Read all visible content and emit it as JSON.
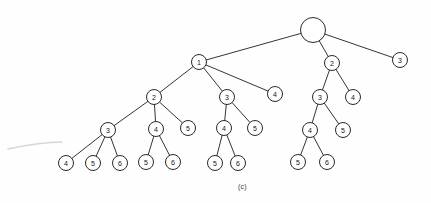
{
  "figure": {
    "caption": "(c)",
    "caption_x": 238,
    "caption_y": 183,
    "width": 431,
    "height": 203,
    "background_color": "#fefefe",
    "ink_color": "#1d1d1d",
    "artifact_color": "#d8d6d2"
  },
  "chart_data": {
    "type": "diagram",
    "title": "(c)",
    "diagram_kind": "rooted-tree",
    "node_radius": 7.5,
    "root_radius": 12.5,
    "nodes": [
      {
        "id": "root",
        "label": "",
        "x": 313,
        "y": 30,
        "r": 12.5,
        "level": 0
      },
      {
        "id": "n1",
        "label": "1",
        "x": 199,
        "y": 62,
        "r": 7.5,
        "level": 1
      },
      {
        "id": "n2",
        "label": "2",
        "x": 332,
        "y": 63,
        "r": 7.5,
        "level": 1
      },
      {
        "id": "n3",
        "label": "3",
        "x": 400,
        "y": 60,
        "r": 7.5,
        "level": 1
      },
      {
        "id": "n1a",
        "label": "2",
        "x": 154,
        "y": 97,
        "r": 7.5,
        "level": 2
      },
      {
        "id": "n1b",
        "label": "3",
        "x": 227,
        "y": 97,
        "r": 7.5,
        "level": 2
      },
      {
        "id": "n1c",
        "label": "4",
        "x": 275,
        "y": 94,
        "r": 7.5,
        "level": 2
      },
      {
        "id": "n2a",
        "label": "3",
        "x": 320,
        "y": 97,
        "r": 7.5,
        "level": 2
      },
      {
        "id": "n2b",
        "label": "4",
        "x": 353,
        "y": 97,
        "r": 7.5,
        "level": 2
      },
      {
        "id": "n1a1",
        "label": "3",
        "x": 108,
        "y": 130,
        "r": 7.5,
        "level": 3
      },
      {
        "id": "n1a2",
        "label": "4",
        "x": 156,
        "y": 129,
        "r": 7.5,
        "level": 3
      },
      {
        "id": "n1a3",
        "label": "5",
        "x": 188,
        "y": 128,
        "r": 7.5,
        "level": 3
      },
      {
        "id": "n1b1",
        "label": "4",
        "x": 224,
        "y": 128,
        "r": 7.5,
        "level": 3
      },
      {
        "id": "n1b2",
        "label": "5",
        "x": 255,
        "y": 128,
        "r": 7.5,
        "level": 3
      },
      {
        "id": "n2a1",
        "label": "4",
        "x": 310,
        "y": 130,
        "r": 7.5,
        "level": 3
      },
      {
        "id": "n2a2",
        "label": "5",
        "x": 343,
        "y": 130,
        "r": 7.5,
        "level": 3
      },
      {
        "id": "n1a1x",
        "label": "4",
        "x": 66,
        "y": 163,
        "r": 7.5,
        "level": 4
      },
      {
        "id": "n1a1y",
        "label": "5",
        "x": 93,
        "y": 163,
        "r": 7.5,
        "level": 4
      },
      {
        "id": "n1a1z",
        "label": "6",
        "x": 120,
        "y": 163,
        "r": 7.5,
        "level": 4
      },
      {
        "id": "n1a2x",
        "label": "5",
        "x": 146,
        "y": 162,
        "r": 7.5,
        "level": 4
      },
      {
        "id": "n1a2y",
        "label": "6",
        "x": 173,
        "y": 162,
        "r": 7.5,
        "level": 4
      },
      {
        "id": "n1b1x",
        "label": "5",
        "x": 215,
        "y": 163,
        "r": 7.5,
        "level": 4
      },
      {
        "id": "n1b1y",
        "label": "6",
        "x": 238,
        "y": 163,
        "r": 7.5,
        "level": 4
      },
      {
        "id": "n2a1x",
        "label": "5",
        "x": 298,
        "y": 162,
        "r": 7.5,
        "level": 4
      },
      {
        "id": "n2a1y",
        "label": "6",
        "x": 327,
        "y": 162,
        "r": 7.5,
        "level": 4
      }
    ],
    "edges": [
      {
        "from": "root",
        "to": "n1"
      },
      {
        "from": "root",
        "to": "n2"
      },
      {
        "from": "root",
        "to": "n3"
      },
      {
        "from": "n1",
        "to": "n1a"
      },
      {
        "from": "n1",
        "to": "n1b"
      },
      {
        "from": "n1",
        "to": "n1c"
      },
      {
        "from": "n2",
        "to": "n2a"
      },
      {
        "from": "n2",
        "to": "n2b"
      },
      {
        "from": "n1a",
        "to": "n1a1"
      },
      {
        "from": "n1a",
        "to": "n1a2"
      },
      {
        "from": "n1a",
        "to": "n1a3"
      },
      {
        "from": "n1b",
        "to": "n1b1"
      },
      {
        "from": "n1b",
        "to": "n1b2"
      },
      {
        "from": "n2a",
        "to": "n2a1"
      },
      {
        "from": "n2a",
        "to": "n2a2"
      },
      {
        "from": "n1a1",
        "to": "n1a1x"
      },
      {
        "from": "n1a1",
        "to": "n1a1y"
      },
      {
        "from": "n1a1",
        "to": "n1a1z"
      },
      {
        "from": "n1a2",
        "to": "n1a2x"
      },
      {
        "from": "n1a2",
        "to": "n1a2y"
      },
      {
        "from": "n1b1",
        "to": "n1b1x"
      },
      {
        "from": "n1b1",
        "to": "n1b1y"
      },
      {
        "from": "n2a1",
        "to": "n2a1x"
      },
      {
        "from": "n2a1",
        "to": "n2a1y"
      }
    ],
    "artifacts": [
      {
        "id": "scan-smudge",
        "path": "M 8 149 C 22 146, 40 142, 62 142"
      }
    ]
  }
}
